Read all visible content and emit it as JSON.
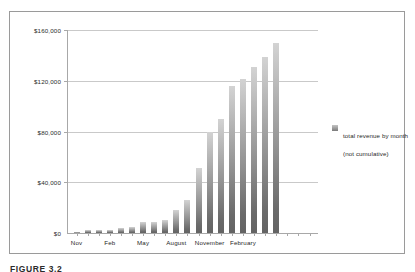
{
  "figure": {
    "caption": "FIGURE 3.2"
  },
  "legend": {
    "line1": "total revenue by month",
    "line2": "(not cumulative)",
    "swatch_color": "#8f8f8f",
    "position": "right"
  },
  "chart_data": {
    "type": "bar",
    "title": "",
    "xlabel": "",
    "ylabel": "",
    "ylim": [
      0,
      160000
    ],
    "yticks": [
      0,
      40000,
      80000,
      120000,
      160000
    ],
    "ytick_labels": [
      "$0",
      "$40,000",
      "$80,000",
      "$120,000",
      "$160,000"
    ],
    "grid": true,
    "bar_color": "#8f8f8f",
    "categories": [
      "Nov",
      "Dec",
      "Jan",
      "Feb",
      "Mar",
      "Apr",
      "May",
      "Jun",
      "Jul",
      "August",
      "Sep",
      "Oct",
      "November",
      "Dec",
      "Jan",
      "February",
      "Mar",
      "Apr",
      "May",
      "Jun",
      "Jul",
      "Aug"
    ],
    "xtick_labels": [
      "Nov",
      "Feb",
      "May",
      "August",
      "November",
      "February"
    ],
    "xtick_indices": [
      0,
      3,
      6,
      9,
      12,
      15
    ],
    "series": [
      {
        "name": "total revenue by month (not cumulative)",
        "values": [
          700,
          2400,
          2400,
          2600,
          3800,
          4600,
          9000,
          8800,
          10000,
          18500,
          26000,
          51000,
          80000,
          90000,
          116000,
          121500,
          131000,
          139000,
          150000,
          0,
          0,
          0
        ]
      }
    ]
  }
}
